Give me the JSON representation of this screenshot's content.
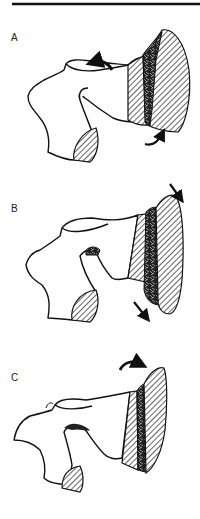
{
  "figure": {
    "panels": [
      {
        "label": "A",
        "description": "bone with hatched cut surfaces; curved arrows indicate rotation"
      },
      {
        "label": "B",
        "description": "fragment displaced outward; straight arrows indicate translation"
      },
      {
        "label": "C",
        "description": "fragment hinged; curved arrow indicates rotation"
      }
    ]
  }
}
